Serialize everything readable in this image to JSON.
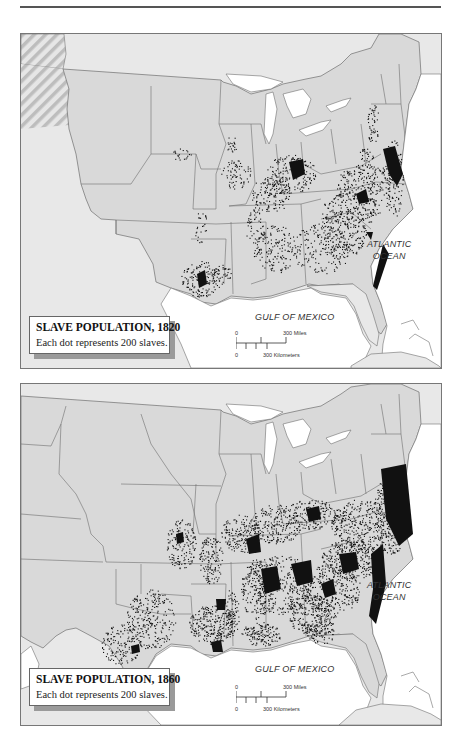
{
  "maps": [
    {
      "id": "1820",
      "legend": {
        "title": "SLAVE POPULATION, 1820",
        "subtitle": "Each dot represents 200 slaves."
      },
      "labels": {
        "atlantic_line1": "ATLANTIC",
        "atlantic_line2": "OCEAN",
        "gulf": "GULF OF MEXICO"
      },
      "scale": {
        "miles_zero": "0",
        "miles_label": "300 Miles",
        "km_zero": "0",
        "km_label": "300 Kilometers"
      }
    },
    {
      "id": "1860",
      "legend": {
        "title": "SLAVE POPULATION, 1860",
        "subtitle": "Each dot represents 200 slaves."
      },
      "labels": {
        "atlantic_line1": "ATLANTIC",
        "atlantic_line2": "OCEAN",
        "gulf": "GULF OF MEXICO"
      },
      "scale": {
        "miles_zero": "0",
        "miles_label": "300 Miles",
        "km_zero": "0",
        "km_label": "300 Kilometers"
      }
    }
  ],
  "colors": {
    "us_land": "#d9d9d9",
    "foreign_land": "#e8e8e8",
    "water": "#ffffff",
    "border": "#6e6e6e",
    "dots": "#111111",
    "disputed_hatch": "#bdbdbd"
  }
}
